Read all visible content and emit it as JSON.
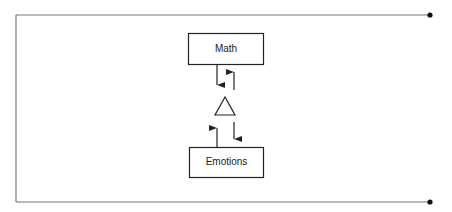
{
  "diagram": {
    "nodes": [
      {
        "id": "math",
        "label": "Math"
      },
      {
        "id": "mediator",
        "label": "",
        "shape": "triangle"
      },
      {
        "id": "emotions",
        "label": "Emotions"
      }
    ],
    "edges": [
      {
        "from": "math",
        "to": "mediator"
      },
      {
        "from": "mediator",
        "to": "math"
      },
      {
        "from": "mediator",
        "to": "emotions"
      },
      {
        "from": "emotions",
        "to": "mediator"
      }
    ],
    "colors": {
      "line": "#333333",
      "frame": "#777777"
    }
  }
}
